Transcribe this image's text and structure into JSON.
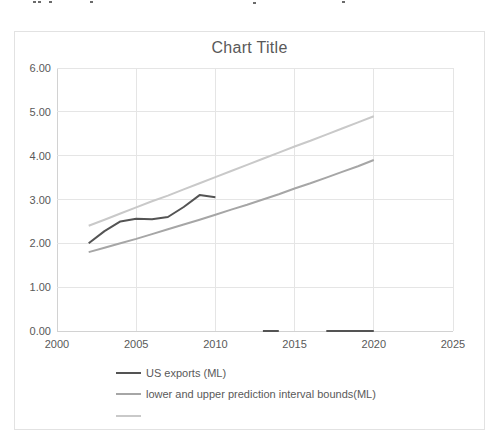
{
  "page": {
    "background": "#ffffff"
  },
  "chart_data": {
    "type": "line",
    "title": "Chart Title",
    "xlabel": "",
    "ylabel": "",
    "xlim": [
      2000,
      2025
    ],
    "ylim": [
      0,
      6
    ],
    "grid": true,
    "legend_position": "bottom-left",
    "x_tick_values": [
      2000,
      2005,
      2010,
      2015,
      2020,
      2025
    ],
    "x_tick_labels": [
      "2000",
      "2005",
      "2010",
      "2015",
      "2020",
      "2025"
    ],
    "y_tick_values": [
      0,
      1,
      2,
      3,
      4,
      5,
      6
    ],
    "y_tick_labels": [
      "0.00",
      "1.00",
      "2.00",
      "3.00",
      "4.00",
      "5.00",
      "6.00"
    ],
    "colors": {
      "series_dark": "#545454",
      "series_mid": "#a6a6a6",
      "series_light": "#c9c9c9",
      "gridline": "#e5e5e5",
      "axis_line": "#d2d2d2",
      "text": "#595959"
    },
    "series": [
      {
        "name": "US exports (ML)",
        "color": "#545454",
        "segments": [
          [
            [
              2002,
              2.0
            ],
            [
              2003,
              2.28
            ],
            [
              2004,
              2.5
            ],
            [
              2005,
              2.56
            ],
            [
              2006,
              2.55
            ],
            [
              2007,
              2.6
            ],
            [
              2008,
              2.83
            ],
            [
              2009,
              3.1
            ],
            [
              2010,
              3.05
            ]
          ],
          [
            [
              2013,
              0.0
            ],
            [
              2014,
              0.0
            ]
          ],
          [
            [
              2017,
              0.0
            ],
            [
              2018,
              0.0
            ],
            [
              2019,
              0.0
            ],
            [
              2020,
              0.0
            ]
          ]
        ]
      },
      {
        "name": "lower prediction interval bound (ML)",
        "color": "#a6a6a6",
        "segments": [
          [
            [
              2002,
              1.8
            ],
            [
              2003,
              1.9
            ],
            [
              2004,
              2.0
            ],
            [
              2005,
              2.1
            ],
            [
              2006,
              2.21
            ],
            [
              2007,
              2.32
            ],
            [
              2008,
              2.43
            ],
            [
              2009,
              2.54
            ],
            [
              2010,
              2.65
            ],
            [
              2011,
              2.77
            ],
            [
              2012,
              2.88
            ],
            [
              2013,
              3.0
            ],
            [
              2014,
              3.12
            ],
            [
              2015,
              3.25
            ],
            [
              2016,
              3.37
            ],
            [
              2017,
              3.5
            ],
            [
              2018,
              3.63
            ],
            [
              2019,
              3.76
            ],
            [
              2020,
              3.9
            ]
          ]
        ]
      },
      {
        "name": "upper prediction interval bound (ML)",
        "color": "#c9c9c9",
        "segments": [
          [
            [
              2002,
              2.4
            ],
            [
              2003,
              2.54
            ],
            [
              2004,
              2.68
            ],
            [
              2005,
              2.82
            ],
            [
              2006,
              2.96
            ],
            [
              2007,
              3.09
            ],
            [
              2008,
              3.23
            ],
            [
              2009,
              3.37
            ],
            [
              2010,
              3.51
            ],
            [
              2011,
              3.65
            ],
            [
              2012,
              3.79
            ],
            [
              2013,
              3.93
            ],
            [
              2014,
              4.07
            ],
            [
              2015,
              4.21
            ],
            [
              2016,
              4.34
            ],
            [
              2017,
              4.48
            ],
            [
              2018,
              4.62
            ],
            [
              2019,
              4.76
            ],
            [
              2020,
              4.9
            ]
          ]
        ]
      }
    ],
    "legend": [
      {
        "label": "US exports (ML)",
        "color": "#545454"
      },
      {
        "label": "lower and upper prediction interval bounds(ML)",
        "color": "#a6a6a6"
      },
      {
        "label": "",
        "color": "#c9c9c9"
      }
    ]
  }
}
